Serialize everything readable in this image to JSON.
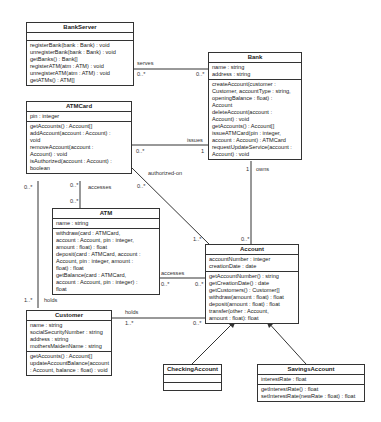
{
  "classes": {
    "bankserver": {
      "name": "BankServer",
      "attributes": [],
      "operations": [
        "registerBank(bank : Bank) : void",
        "unregisterBank(bank : Bank) : void",
        "getBanks() : Bank[]",
        "registerATM(atm : ATM) : void",
        "unregisterATM(atm : ATM) : void",
        "getATMs() : ATM[]"
      ]
    },
    "bank": {
      "name": "Bank",
      "attributes": [
        "name : string",
        "address : string"
      ],
      "operations": [
        "createAccount(customer :",
        "Customer, accountType : string,",
        "openingBalance : float) :",
        "Account",
        "deleteAccount(account :",
        "Account) : void",
        "getAccounts() : Account[]",
        "issueATMCard(pin : integer,",
        "account : Account) : ATMCard",
        "requestUpdateService(account :",
        "Account) : void"
      ]
    },
    "atmcard": {
      "name": "ATMCard",
      "attributes": [
        "pin : integer"
      ],
      "operations": [
        "getAccounts() : Account[]",
        "addAccount(account : Account) :",
        "void",
        "removeAccount(account :",
        "Account) : void",
        "isAuthorized(account : Account) :",
        "boolean"
      ]
    },
    "atm": {
      "name": "ATM",
      "attributes": [
        "name : string"
      ],
      "operations": [
        "withdraw(card : ATMCard,",
        "account : Account, pin : integer,",
        "amount : float) : float",
        "deposit(card : ATMCard, account :",
        "Account, pin : integer, amount :",
        "float) : float",
        "getBalance(card : ATMCard,",
        "account : Account, pin : integer) :",
        "float"
      ]
    },
    "account": {
      "name": "Account",
      "attributes": [
        "accountNumber : integer",
        "creationDate : date"
      ],
      "operations": [
        "getAccountNumber() : string",
        "getCreationDate() : date",
        "getCustomers() : Customer[]",
        "withdraw(amount : float) : float",
        "deposit(amount : float) : float",
        "transfer(other : Account,",
        "amount : float): float"
      ]
    },
    "customer": {
      "name": "Customer",
      "attributes": [
        "name : string",
        "socialSecurityNumber : string",
        "address : string",
        "mothersMaidenName : string"
      ],
      "operations": [
        "getAccounts() : Account[]",
        "updateAccountBalance(account",
        ": Account, balance : float) : void"
      ]
    },
    "checking": {
      "name": "CheckingAccount",
      "attributes": [],
      "operations": []
    },
    "savings": {
      "name": "SavingsAccount",
      "attributes": [
        "interestRate : float"
      ],
      "operations": [
        "getInterestRate() : float",
        "setInterestRate(newRate : float) : float"
      ]
    }
  },
  "associations": {
    "serves": {
      "name": "serves",
      "m1": "0..*",
      "m2": "0..*"
    },
    "issues": {
      "name": "issues",
      "m1": "0..*",
      "m2": "1"
    },
    "owns": {
      "name": "owns",
      "m1": "1",
      "m2": "0..*"
    },
    "authorized_on": {
      "name": "authorized-on",
      "m1": "0..*",
      "m2": "1..*"
    },
    "card_accesses": {
      "name": "accesses",
      "m1": "0..*",
      "m2": "0..*"
    },
    "atm_accesses": {
      "name": "accesses",
      "m1": "0..*",
      "m2": "0..*"
    },
    "card_holds": {
      "name": "holds",
      "m1": "0..*",
      "m2": "1..*"
    },
    "account_holds": {
      "name": "holds",
      "m1": "1..*",
      "m2": "0..*"
    }
  }
}
